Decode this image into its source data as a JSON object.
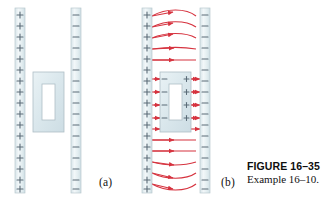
{
  "figure": {
    "caption_title": "FIGURE 16–35",
    "caption_body": "Example 16–10.",
    "panel_a_label": "(a)",
    "panel_b_label": "(b)"
  },
  "colors": {
    "field_line": "#d6333f",
    "plate_fill": "#e3ecef",
    "plate_edge": "#b9c9cf",
    "slab_fill": "#dde8ec",
    "slab_edge": "#aebec6",
    "cavity_fill": "#ffffff",
    "positive_sign": "#5a6b77",
    "negative_sign": "#5a6b77",
    "induced_sign": "#5a6b77",
    "caption_text": "#111111"
  },
  "panel_a": {
    "left_plate": {
      "charge": "+",
      "x": 15,
      "y": 8,
      "w": 10,
      "h": 185,
      "sign_count": 16
    },
    "right_plate": {
      "charge": "−",
      "x": 71,
      "y": 8,
      "w": 10,
      "h": 185,
      "sign_count": 16
    },
    "slab": {
      "x": 33,
      "y": 72,
      "w": 31,
      "h": 60,
      "cavity_x": 42,
      "cavity_y": 84,
      "cavity_w": 13,
      "cavity_h": 36
    },
    "field_lines": 0
  },
  "panel_b": {
    "left_plate": {
      "charge": "+",
      "x": 142,
      "y": 8,
      "w": 10,
      "h": 185,
      "sign_count": 16
    },
    "right_plate": {
      "charge": "−",
      "x": 200,
      "y": 8,
      "w": 10,
      "h": 185,
      "sign_count": 16
    },
    "slab": {
      "x": 160,
      "y": 72,
      "w": 31,
      "h": 60,
      "cavity_x": 169,
      "cavity_y": 84,
      "cavity_w": 13,
      "cavity_h": 36
    },
    "slab_left_face_charge": "−",
    "slab_right_face_charge": "+",
    "field_lines": 16,
    "field_direction": "left-to-right",
    "fringing": "lines bow outward near top and bottom edges; lines terminate on slab left face and restart at slab right face"
  }
}
